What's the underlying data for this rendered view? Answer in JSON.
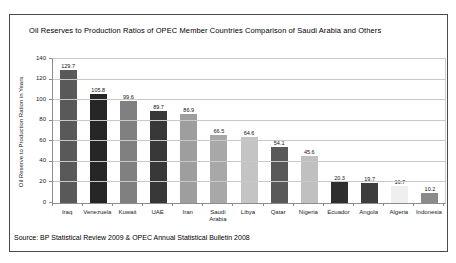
{
  "window": {
    "background": "#ffffff",
    "frame_border_color": "#4a4a4a"
  },
  "chart_data": {
    "type": "bar",
    "title": "Oil Reserves to Production Ratios of OPEC Member Countries Comparison of Saudi Arabia and Others",
    "ylabel": "Oil Reserve to Production Ration in Years",
    "xlabel": "",
    "source_note": "Source: BP Statistical Review 2009 & OPEC Annual Statistical Bulletin 2008",
    "ylim": [
      0,
      140
    ],
    "yticks": [
      0,
      20,
      40,
      60,
      80,
      100,
      120,
      140
    ],
    "grid": true,
    "legend": "none",
    "categories": [
      "Iraq",
      "Venezuela",
      "Kuwait",
      "UAE",
      "Iran",
      "Saudi Arabia",
      "Libya",
      "Qatar",
      "Nigeria",
      "Ecuador",
      "Angola",
      "Algeria",
      "Indonesia"
    ],
    "values": [
      129.7,
      105.8,
      99.6,
      89.7,
      86.9,
      66.5,
      64.6,
      54.1,
      45.6,
      20.3,
      19.7,
      16.7,
      10.2
    ],
    "bar_colors": [
      "#595959",
      "#262626",
      "#808080",
      "#383838",
      "#9e9e9e",
      "#a8a8a8",
      "#c4c4c4",
      "#595959",
      "#c0c0c0",
      "#2e2e2e",
      "#3d3d3d",
      "#efefef",
      "#8a8a8a"
    ],
    "gridline_color": "#c9c9c9",
    "axis_color": "#8c8c8c",
    "label_color": "#111111"
  }
}
